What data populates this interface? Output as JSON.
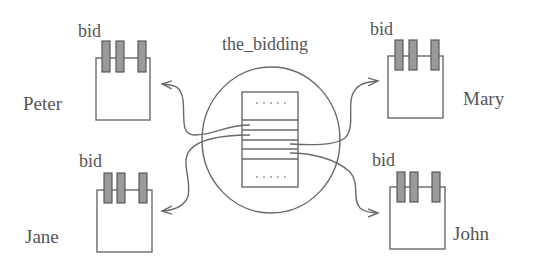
{
  "diagram": {
    "center": {
      "title": "the_bidding",
      "shape": "ellipse",
      "record_slots": 5
    },
    "participants": [
      {
        "name": "Peter",
        "buffer_label": "bid",
        "position": "top-left"
      },
      {
        "name": "Mary",
        "buffer_label": "bid",
        "position": "top-right"
      },
      {
        "name": "Jane",
        "buffer_label": "bid",
        "position": "bottom-left"
      },
      {
        "name": "John",
        "buffer_label": "bid",
        "position": "bottom-right"
      }
    ],
    "connections": [
      {
        "from": "the_bidding",
        "to": "Peter"
      },
      {
        "from": "the_bidding",
        "to": "Mary"
      },
      {
        "from": "the_bidding",
        "to": "Jane"
      },
      {
        "from": "the_bidding",
        "to": "John"
      }
    ],
    "colors": {
      "stroke": "#6a6a6a",
      "clip_fill": "#9a9a9a",
      "text": "#555555"
    }
  }
}
